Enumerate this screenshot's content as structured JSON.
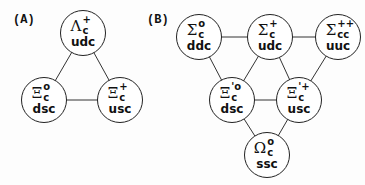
{
  "panels": {
    "a": {
      "label": "(A)",
      "nodes": [
        {
          "greek": "Λ",
          "sup": "+",
          "sub": "c",
          "quarks": "udc"
        },
        {
          "greek": "Ξ",
          "sup": "o",
          "sub": "c",
          "quarks": "dsc"
        },
        {
          "greek": "Ξ",
          "sup": "+",
          "sub": "c",
          "quarks": "usc"
        }
      ]
    },
    "b": {
      "label": "(B)",
      "nodes": [
        {
          "greek": "Σ",
          "sup": "o",
          "sub": "c",
          "quarks": "ddc"
        },
        {
          "greek": "Σ",
          "sup": "+",
          "sub": "c",
          "quarks": "udc"
        },
        {
          "greek": "Σ",
          "sup": "++",
          "sub": "cc",
          "quarks": "uuc"
        },
        {
          "greek": "Ξ",
          "sup": "'o",
          "sub": "c",
          "quarks": "dsc"
        },
        {
          "greek": "Ξ",
          "sup": "'+",
          "sub": "c",
          "quarks": "usc"
        },
        {
          "greek": "Ω",
          "sup": "o",
          "sub": "c",
          "quarks": "ssc"
        }
      ]
    }
  },
  "colors": {
    "line": "#222222",
    "text": "#111111",
    "background": "#fdfdfd"
  }
}
